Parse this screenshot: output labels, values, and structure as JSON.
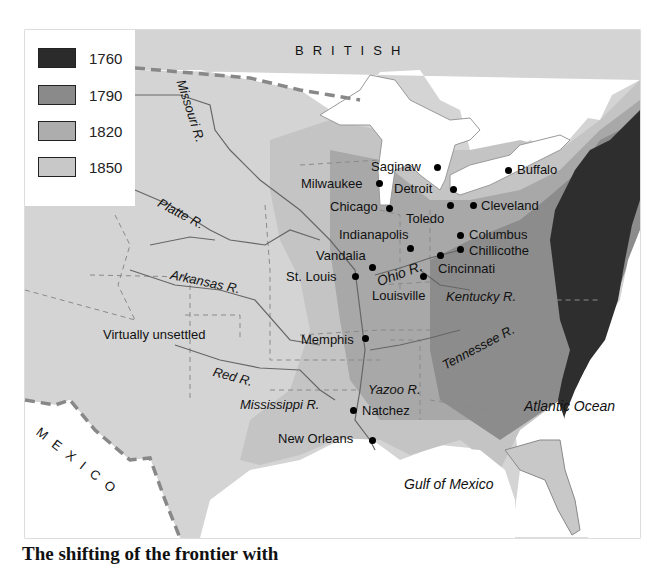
{
  "legend": {
    "items": [
      {
        "label": "1760",
        "color": "#2b2b2b"
      },
      {
        "label": "1790",
        "color": "#8a8a8a"
      },
      {
        "label": "1820",
        "color": "#adadad"
      },
      {
        "label": "1850",
        "color": "#c8c8c8"
      }
    ]
  },
  "regions": {
    "british": "BRITISH",
    "mexico": "MEXICO",
    "unsettled": "Virtually unsettled",
    "atlantic": "Atlantic Ocean",
    "gulf": "Gulf of Mexico"
  },
  "rivers": {
    "missouri": "Missouri R.",
    "platte": "Platte R.",
    "arkansas": "Arkansas R.",
    "red": "Red R.",
    "ohio": "Ohio R.",
    "kentucky": "Kentucky R.",
    "tennessee": "Tennessee R.",
    "yazoo": "Yazoo R.",
    "mississippi": "Mississippi R."
  },
  "cities": [
    {
      "name": "Saginaw"
    },
    {
      "name": "Milwaukee"
    },
    {
      "name": "Detroit"
    },
    {
      "name": "Buffalo"
    },
    {
      "name": "Chicago"
    },
    {
      "name": "Toledo"
    },
    {
      "name": "Cleveland"
    },
    {
      "name": "Indianapolis"
    },
    {
      "name": "Columbus"
    },
    {
      "name": "Chillicothe"
    },
    {
      "name": "Vandalia"
    },
    {
      "name": "Cincinnati"
    },
    {
      "name": "St. Louis"
    },
    {
      "name": "Louisville"
    },
    {
      "name": "Memphis"
    },
    {
      "name": "Natchez"
    },
    {
      "name": "New Orleans"
    }
  ],
  "colors": {
    "unsettled": "#d4d4d4",
    "settled1850": "#c2c2c2",
    "settled1820": "#a9a9a9",
    "settled1790": "#8c8c8c",
    "settled1760": "#2e2e2e",
    "water": "#ffffff",
    "border": "#7a7a7a"
  },
  "caption": "The shifting of the frontier with"
}
